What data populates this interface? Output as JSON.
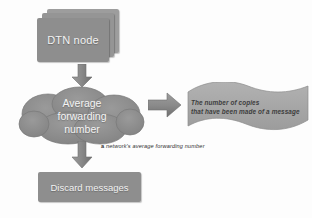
{
  "diagram": {
    "background_color": "#fdfdfd",
    "shape_fill": "#8e8e8e",
    "banner_fill": "#a8a8a8",
    "text_light": "#f2f2f2",
    "text_dark": "#3d3d3d"
  },
  "nodes": {
    "dtn_node": {
      "label": "DTN node",
      "shape": "stacked-boxes",
      "stack_count": 3
    },
    "cloud": {
      "shape": "cloud",
      "lines": [
        "Average",
        "forwarding",
        "number"
      ]
    },
    "banner": {
      "shape": "wave-banner",
      "lines": [
        "The number of copies",
        "that have been made of a message"
      ]
    },
    "discard": {
      "label": "Discard messages",
      "shape": "box"
    }
  },
  "captions": {
    "forwarding_number": {
      "lead": "a",
      "text": "network's average  forwarding number"
    }
  },
  "arrows": [
    {
      "name": "arrow-down-node-to-cloud",
      "direction": "down"
    },
    {
      "name": "arrow-right-cloud-to-banner",
      "direction": "right"
    },
    {
      "name": "arrow-down-cloud-to-discard",
      "direction": "down"
    }
  ]
}
